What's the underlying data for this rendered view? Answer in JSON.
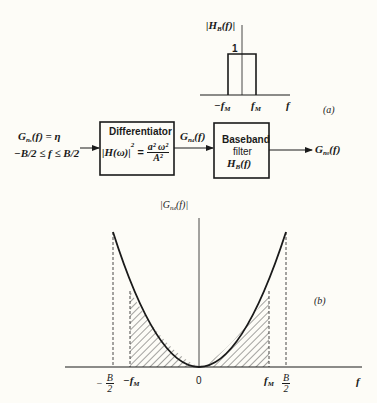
{
  "diagram": {
    "type": "signal-processing-block-diagram-with-spectra",
    "colors": {
      "ink": "#1a1a1a",
      "background": "#fdfcf7"
    },
    "panel_a": {
      "tag": "(a)",
      "y_label": "|H_B(f)|",
      "y_label_main": "|H",
      "y_label_sub": "B",
      "y_label_tail": "(f)|",
      "level_label": "1",
      "x_label": "f",
      "tick_left_main": "−f",
      "tick_left_sub": "M",
      "tick_right_main": "f",
      "tick_right_sub": "M",
      "shape": "rectangular pulse of height 1 from −f_M to f_M"
    },
    "block_diagram": {
      "input": {
        "line1_main": "G",
        "line1_sub": "n",
        "line1_subsub": "s",
        "line1_tail": "(f) = η",
        "line2": "−B/2 ≤ f ≤ B/2"
      },
      "differentiator": {
        "title": "Differentiator",
        "formula_left": "|H(ω)|",
        "formula_exp": "2",
        "formula_eq": "=",
        "formula_num": "a² ω²",
        "formula_den": "A²"
      },
      "middle_signal": {
        "main": "G",
        "sub": "n",
        "subsub": "4",
        "tail": "(f)"
      },
      "baseband": {
        "line1": "Baseband",
        "line2": "filter",
        "line3_main": "H",
        "line3_sub": "B",
        "line3_tail": "(f)"
      },
      "output": {
        "main": "G",
        "sub": "n",
        "subsub": "0",
        "tail": "(f)"
      }
    },
    "panel_b": {
      "tag": "(b)",
      "y_label_main": "|G",
      "y_label_sub": "n",
      "y_label_subsub": "4",
      "y_label_tail": "(f)|",
      "x_label": "f",
      "ticks": {
        "neg_b_sign": "−",
        "b_num": "B",
        "b_den": "2",
        "neg_fm_main": "−f",
        "fm_main": "f",
        "fm_sub": "M",
        "zero": "0"
      },
      "shape": "parabola from −B/2 to B/2, shaded (hatched) region between −f_M and f_M"
    }
  }
}
